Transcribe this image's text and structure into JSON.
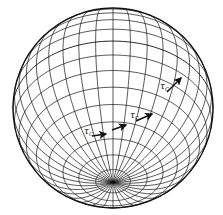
{
  "figure": {
    "type": "sphere-with-loxodrome",
    "background": "#ffffff",
    "stroke_color": "#111111",
    "sphere": {
      "cx": 113,
      "cy": 108,
      "r": 100,
      "pole_elevation_deg": 42,
      "rotation_deg": 0
    },
    "grid": {
      "meridians": 36,
      "parallels_step_deg": 10
    },
    "curve": {
      "name": "loxodrome",
      "stroke_width": 1.6
    },
    "labels": [
      {
        "id": "tau-c-1",
        "text": "τ",
        "sub": "C",
        "x": 84,
        "y": 134
      },
      {
        "id": "tau-c-2",
        "text": "τ",
        "sub": "C",
        "x": 130,
        "y": 118
      },
      {
        "id": "tau-c-3",
        "text": "τ",
        "sub": "C",
        "x": 160,
        "y": 89
      }
    ],
    "arrows": [
      {
        "id": "tangent-arrow-1",
        "x1": 92,
        "y1": 136,
        "x2": 106,
        "y2": 134
      },
      {
        "id": "direction-arrow",
        "x1": 112,
        "y1": 130,
        "x2": 126,
        "y2": 125
      },
      {
        "id": "tangent-arrow-2",
        "x1": 136,
        "y1": 121,
        "x2": 152,
        "y2": 114
      },
      {
        "id": "tangent-arrow-3",
        "x1": 167,
        "y1": 92,
        "x2": 181,
        "y2": 78
      }
    ]
  }
}
